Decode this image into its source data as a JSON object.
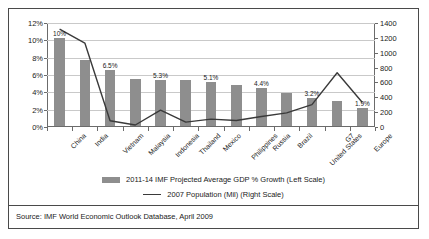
{
  "figure": {
    "source_note": "Source: IMF World Economic Outlook Database, April 2009"
  },
  "legend": {
    "bar_label": "2011-14 IMF Projected Average GDP % Growth (Left Scale)",
    "line_label": "2007 Population (Mil) (Right Scale)"
  },
  "colors": {
    "bar": "#8e8e8e",
    "line": "#3a3a3a",
    "grid": "#c9c9c9",
    "axis": "#6b6b6b",
    "frame": "#4a4a4a",
    "text": "#1a1a1a"
  },
  "chart_data": {
    "type": "bar",
    "title": "",
    "xlabel": "",
    "ylabel": "",
    "grid": true,
    "legend_position": "bottom",
    "categories": [
      "China",
      "India",
      "Vietnam",
      "Malaysia",
      "Indonesia",
      "Thailand",
      "Mexico",
      "Philippines",
      "Russia",
      "Brazil",
      "United States",
      "G7",
      "Europe"
    ],
    "series": [
      {
        "name": "2011-14 IMF Projected Average GDP % Growth (Left Scale)",
        "type": "bar",
        "axis": "left",
        "values": [
          10.2,
          7.6,
          6.5,
          5.4,
          5.3,
          5.3,
          5.1,
          4.7,
          4.4,
          3.8,
          3.2,
          2.9,
          2.1
        ],
        "point_labels": [
          "10%",
          "",
          "6.5%",
          "",
          "5.3%",
          "",
          "5.1%",
          "",
          "4.4%",
          "",
          "3.2%",
          "",
          "1.9%"
        ]
      },
      {
        "name": "2007 Population (Mil) (Right Scale)",
        "type": "line",
        "axis": "right",
        "values": [
          1318,
          1130,
          85,
          27,
          226,
          66,
          106,
          88,
          142,
          190,
          302,
          730,
          330
        ]
      }
    ],
    "left_axis": {
      "ticks": [
        "0%",
        "2%",
        "4%",
        "6%",
        "8%",
        "10%",
        "12%"
      ],
      "tick_values": [
        0,
        2,
        4,
        6,
        8,
        10,
        12
      ],
      "ylim": [
        0,
        12
      ]
    },
    "right_axis": {
      "ticks": [
        "0",
        "200",
        "400",
        "600",
        "800",
        "1000",
        "1200",
        "1400"
      ],
      "tick_values": [
        0,
        200,
        400,
        600,
        800,
        1000,
        1200,
        1400
      ],
      "ylim": [
        0,
        1400
      ]
    }
  }
}
